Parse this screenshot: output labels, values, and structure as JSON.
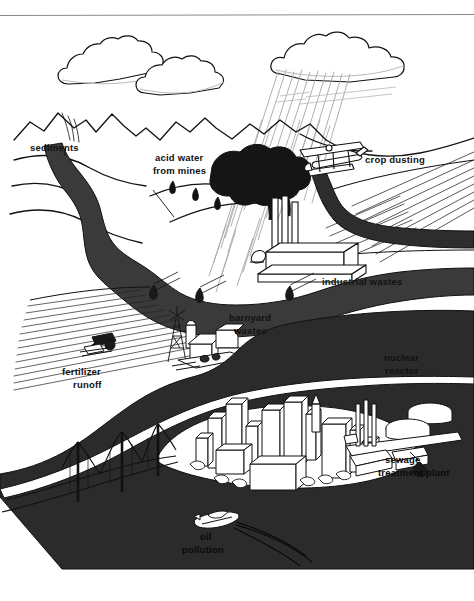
{
  "figure": {
    "background_color": "#ffffff",
    "ink_color": "#111111",
    "water_fill_color": "#2b2b2b",
    "river_fill_color": "#3a3a3a",
    "hatch_color": "#222222",
    "rain_color": "#9a9a9a",
    "top_rule": {
      "color": "#8a8a8a",
      "y": 15
    }
  },
  "labels": [
    {
      "id": "sediments",
      "text": "sediments",
      "x": 30,
      "y": 148,
      "on_water": false
    },
    {
      "id": "acid-water-1",
      "text": "acid water",
      "x": 155,
      "y": 158,
      "on_water": false
    },
    {
      "id": "acid-water-2",
      "text": "from mines",
      "x": 153,
      "y": 171,
      "on_water": false
    },
    {
      "id": "crop-dusting",
      "text": "crop dusting",
      "x": 365,
      "y": 160,
      "on_water": false
    },
    {
      "id": "industrial-wastes",
      "text": "industrial wastes",
      "x": 322,
      "y": 282,
      "on_water": false
    },
    {
      "id": "barnyard-wastes-1",
      "text": "barnyard",
      "x": 229,
      "y": 318,
      "on_water": false
    },
    {
      "id": "barnyard-wastes-2",
      "text": "wastes",
      "x": 234,
      "y": 331,
      "on_water": false
    },
    {
      "id": "nuclear-reactor-1",
      "text": "nuclear",
      "x": 384,
      "y": 358,
      "on_water": false
    },
    {
      "id": "nuclear-reactor-2",
      "text": "reactor",
      "x": 385,
      "y": 371,
      "on_water": false
    },
    {
      "id": "fertilizer-runoff-1",
      "text": "fertilizer",
      "x": 62,
      "y": 372,
      "on_water": false
    },
    {
      "id": "fertilizer-runoff-2",
      "text": "runoff",
      "x": 73,
      "y": 385,
      "on_water": false
    },
    {
      "id": "sewage-plant-1",
      "text": "sewage",
      "x": 385,
      "y": 460,
      "on_water": true
    },
    {
      "id": "sewage-plant-2",
      "text": "treatment plant",
      "x": 378,
      "y": 473,
      "on_water": true
    },
    {
      "id": "oil-pollution-1",
      "text": "oil",
      "x": 200,
      "y": 537,
      "on_water": true
    },
    {
      "id": "oil-pollution-2",
      "text": "pollution",
      "x": 182,
      "y": 550,
      "on_water": true
    }
  ],
  "scene_elements": [
    {
      "id": "clouds",
      "name": "cloud-group",
      "count": 3
    },
    {
      "id": "rainfall",
      "name": "rain-streaks",
      "count": 30
    },
    {
      "id": "mountains",
      "name": "mountain-range",
      "count": 5
    },
    {
      "id": "river",
      "name": "polluted-river",
      "count": 1
    },
    {
      "id": "smoke-plume",
      "name": "smoke-plume",
      "count": 1
    },
    {
      "id": "smokestacks",
      "name": "factory-smokestacks",
      "count": 3
    },
    {
      "id": "factory",
      "name": "industrial-plant",
      "count": 1
    },
    {
      "id": "crop-duster-plane",
      "name": "crop-duster-airplane",
      "count": 1
    },
    {
      "id": "crop-field",
      "name": "hatched-crop-field",
      "count": 1
    },
    {
      "id": "fertilizer-field",
      "name": "hatched-fertilizer-field",
      "count": 1
    },
    {
      "id": "tractor",
      "name": "tractor",
      "count": 1
    },
    {
      "id": "farm",
      "name": "barn-and-silo",
      "count": 1
    },
    {
      "id": "windmill",
      "name": "farm-windmill",
      "count": 1
    },
    {
      "id": "reactor-dome",
      "name": "nuclear-reactor-dome",
      "count": 1
    },
    {
      "id": "city",
      "name": "city-skyline-buildings",
      "count": 14
    },
    {
      "id": "bridge",
      "name": "suspension-bridge",
      "count": 1
    },
    {
      "id": "sewage-tanks",
      "name": "sewage-treatment-tanks",
      "count": 2
    },
    {
      "id": "boat",
      "name": "motorboat",
      "count": 1
    },
    {
      "id": "oil-slick",
      "name": "oil-slick-trail",
      "count": 3
    },
    {
      "id": "outfall-pipes",
      "name": "discharge-pipes",
      "count": 5
    },
    {
      "id": "bay",
      "name": "bay-water-body",
      "count": 1
    }
  ]
}
